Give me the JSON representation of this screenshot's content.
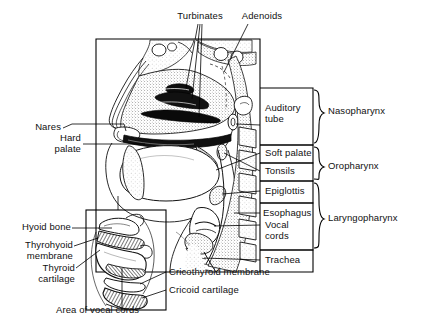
{
  "figure": {
    "background_color": "#ffffff",
    "line_color": "#000000"
  },
  "labels": {
    "top": [
      {
        "id": "turbinates",
        "text": "Turbinates"
      },
      {
        "id": "adenoids",
        "text": "Adenoids"
      }
    ],
    "left": [
      {
        "id": "nares",
        "text": "Nares"
      },
      {
        "id": "hard-palate",
        "text": "Hard\npalate"
      }
    ],
    "right_column": [
      {
        "id": "auditory-tube",
        "text": "Auditory\ntube"
      },
      {
        "id": "soft-palate",
        "text": "Soft palate"
      },
      {
        "id": "tonsils",
        "text": "Tonsils"
      },
      {
        "id": "epiglottis",
        "text": "Epiglottis"
      },
      {
        "id": "esophagus",
        "text": "Esophagus"
      },
      {
        "id": "vocal-cords",
        "text": "Vocal\ncords"
      },
      {
        "id": "trachea",
        "text": "Trachea"
      }
    ],
    "regions": [
      {
        "id": "nasopharynx",
        "text": "Nasopharynx"
      },
      {
        "id": "oropharynx",
        "text": "Oropharynx"
      },
      {
        "id": "laryngopharynx",
        "text": "Laryngopharynx"
      }
    ],
    "inset_left": [
      {
        "id": "hyoid-bone",
        "text": "Hyoid bone"
      },
      {
        "id": "thyrohyoid-membrane",
        "text": "Thyrohyoid\nmembrane"
      },
      {
        "id": "thyroid-cartilage",
        "text": "Thyroid\ncartilage"
      }
    ],
    "inset_right": [
      {
        "id": "cricothyroid-membrane",
        "text": "Cricothyroid membrane"
      },
      {
        "id": "cricoid-cartilage",
        "text": "Cricoid cartilage"
      }
    ],
    "inset_bottom": [
      {
        "id": "area-of-vocal-cords",
        "text": "Area of vocal cords"
      }
    ]
  }
}
